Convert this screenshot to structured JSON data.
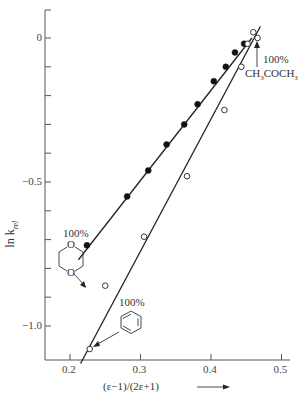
{
  "chart_data": {
    "type": "scatter",
    "title": "",
    "xlabel": "(ε−1)/(2ε+1)",
    "ylabel": "ln k_rel",
    "ylabel_main": "ln k",
    "ylabel_sub": "rel",
    "xlim": [
      0.18,
      0.52
    ],
    "ylim": [
      -1.15,
      0.12
    ],
    "x_ticks": [
      0.2,
      0.3,
      0.4,
      0.5
    ],
    "x_tick_labels": [
      "0.2",
      "0.3",
      "0.4",
      "0.5"
    ],
    "y_ticks": [
      0,
      -0.5,
      -1.0
    ],
    "y_tick_labels": [
      "0",
      "−0.5",
      "−1.0"
    ],
    "y_minor_ticks": [
      -0.1,
      -0.2,
      -0.3,
      -0.4,
      -0.6,
      -0.7,
      -0.8,
      -0.9
    ],
    "grid": false,
    "legend": null,
    "series": [
      {
        "name": "dioxane–acetone mixtures",
        "marker": "filled-circle",
        "x": [
          0.224,
          0.281,
          0.311,
          0.337,
          0.362,
          0.381,
          0.404,
          0.421,
          0.434,
          0.447
        ],
        "y": [
          -0.72,
          -0.55,
          -0.46,
          -0.37,
          -0.3,
          -0.23,
          -0.15,
          -0.1,
          -0.05,
          -0.02
        ],
        "fit_line": {
          "x": [
            0.212,
            0.458
          ],
          "y": [
            -0.77,
            0.0
          ]
        }
      },
      {
        "name": "benzene–acetone mixtures",
        "marker": "open-circle",
        "x": [
          0.228,
          0.25,
          0.305,
          0.366,
          0.419,
          0.443,
          0.452,
          0.46,
          0.466
        ],
        "y": [
          -1.08,
          -0.86,
          -0.69,
          -0.48,
          -0.25,
          -0.1,
          -0.02,
          0.02,
          0.0
        ],
        "fit_line": {
          "x": [
            0.215,
            0.47
          ],
          "y": [
            -1.13,
            0.04
          ]
        }
      }
    ],
    "annotations": [
      {
        "text": "100%",
        "sub": "1,4-dioxane (structure)",
        "points_to": [
          0.224,
          -0.72
        ]
      },
      {
        "text": "100%",
        "sub": "benzene (structure)",
        "points_to": [
          0.228,
          -1.08
        ]
      },
      {
        "text": "100%",
        "sub": "CH₃COCH₃",
        "points_to": [
          0.466,
          0.0
        ]
      }
    ]
  },
  "labels": {
    "ylabel_main": "ln k",
    "ylabel_sub": "rel",
    "xlabel": "(ε−1)/(2ε+1)",
    "dioxane_pct": "100%",
    "benzene_pct": "100%",
    "acetone_pct": "100%",
    "acetone_formula_a": "CH",
    "acetone_formula_b": "3",
    "acetone_formula_c": "COCH",
    "acetone_formula_d": "3",
    "dioxane_O_top": "O",
    "dioxane_O_bottom": "O"
  }
}
